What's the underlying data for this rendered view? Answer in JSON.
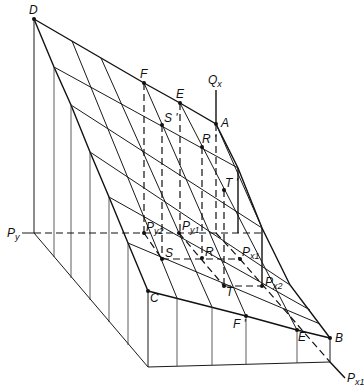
{
  "diagram": {
    "type": "3d-surface-projection",
    "labels": {
      "D": "D",
      "F": "F",
      "E_top": "E",
      "A": "A",
      "Qx": "Q",
      "Qx_sub": "x",
      "S_prime": "S '",
      "R_prime": "R '",
      "T_prime": "T '",
      "Py": "P",
      "Py_sub": "y",
      "Py2": "P",
      "Py2_sub": "y2",
      "Py1": "P",
      "Py1_sub": "y1",
      "S": "S",
      "R": "R",
      "Px1_inner": "P",
      "Px1_inner_sub": "x1",
      "T": "T",
      "Px2": "P",
      "Px2_sub": "x2",
      "C": "C",
      "F_prime": "F '",
      "E_bottom": "E",
      "B": "B",
      "Px1_axis": "P",
      "Px1_axis_sub": "x1"
    },
    "marked_points": [
      "D",
      "F",
      "E",
      "A",
      "S'",
      "R'",
      "T'",
      "Py2",
      "Py1",
      "S",
      "R",
      "Px1",
      "T",
      "Px2",
      "C",
      "F'",
      "E",
      "B"
    ],
    "axes": [
      "Qx",
      "Py",
      "Px1"
    ]
  }
}
